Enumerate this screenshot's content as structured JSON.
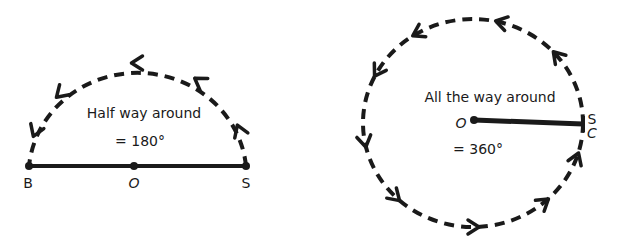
{
  "left_diagram": {
    "caption": "Half way around",
    "angle": "= 180°",
    "points": {
      "start": "S",
      "center": "O",
      "end": "B"
    },
    "turn_fraction": 0.5
  },
  "right_diagram": {
    "caption": "All the way around",
    "angle": "= 360°",
    "points": {
      "start": "S",
      "center": "O",
      "end": "C"
    },
    "turn_fraction": 1.0
  },
  "colors": {
    "ink": "#1a1a1a",
    "background": "#ffffff"
  }
}
